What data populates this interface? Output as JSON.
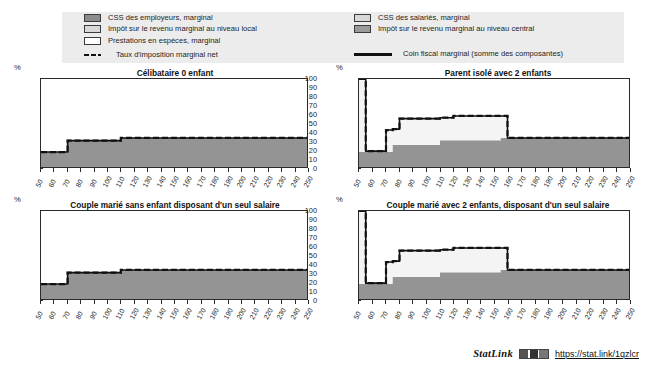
{
  "legend": {
    "left_items": [
      {
        "label": "CSS des employeurs, marginal",
        "swatch": "dark-gray-swatch"
      },
      {
        "label": "Impôt sur le revenu marginal au niveau local",
        "swatch": "light-gray-swatch"
      },
      {
        "label": "Prestations en espèces, marginal",
        "swatch": "white-swatch"
      }
    ],
    "left_line": {
      "label": "Taux d'imposition marginal net",
      "style": "dashed"
    },
    "right_items": [
      {
        "label": "CSS des salariés, marginal",
        "swatch": "light-gray-swatch"
      },
      {
        "label": "Impôt sur le revenu marginal au niveau central",
        "swatch": "mid-gray-swatch"
      }
    ],
    "right_line": {
      "label": "Coin fiscal marginal (somme des composantes)",
      "style": "solid"
    }
  },
  "axis": {
    "y_unit": "%",
    "y_ticks": [
      100,
      90,
      80,
      70,
      60,
      50,
      40,
      30,
      20,
      10,
      0
    ],
    "x_ticks": [
      50,
      60,
      70,
      80,
      90,
      100,
      110,
      120,
      130,
      140,
      150,
      160,
      170,
      180,
      190,
      200,
      210,
      220,
      230,
      240,
      250
    ]
  },
  "statlink": {
    "word": "StatLink",
    "glyph": "statlink-barcode-icon",
    "url": "https://stat.link/1qzlcr"
  },
  "chart_data": [
    {
      "type": "area",
      "panel": "top-left",
      "title": "Célibataire 0 enfant",
      "xlabel": "",
      "ylabel": "%",
      "xlim": [
        50,
        250
      ],
      "ylim": [
        0,
        100
      ],
      "grid": false,
      "x": [
        50,
        60,
        70,
        80,
        90,
        100,
        110,
        120,
        130,
        140,
        150,
        160,
        170,
        180,
        190,
        200,
        210,
        220,
        230,
        240,
        250
      ],
      "series": [
        {
          "name": "CSS des employeurs, marginal",
          "values": [
            17,
            17,
            30,
            30,
            30,
            30,
            33,
            33,
            33,
            33,
            33,
            33,
            33,
            33,
            33,
            33,
            33,
            33,
            33,
            33,
            33
          ]
        },
        {
          "name": "Coin fiscal marginal (somme des composantes)",
          "values": [
            17,
            17,
            30,
            30,
            30,
            30,
            33,
            33,
            33,
            33,
            33,
            33,
            33,
            33,
            33,
            33,
            33,
            33,
            33,
            33,
            33
          ]
        },
        {
          "name": "Taux d'imposition marginal net",
          "values": [
            17,
            17,
            30,
            30,
            30,
            30,
            33,
            33,
            33,
            33,
            33,
            33,
            33,
            33,
            33,
            33,
            33,
            33,
            33,
            33,
            33
          ]
        }
      ]
    },
    {
      "type": "area",
      "panel": "top-right",
      "title": "Parent isolé avec 2 enfants",
      "xlabel": "",
      "ylabel": "%",
      "xlim": [
        50,
        250
      ],
      "ylim": [
        0,
        100
      ],
      "grid": false,
      "x": [
        50,
        52,
        55,
        60,
        65,
        70,
        75,
        80,
        90,
        100,
        110,
        120,
        130,
        140,
        150,
        155,
        160,
        170,
        180,
        190,
        200,
        210,
        220,
        230,
        240,
        250
      ],
      "series": [
        {
          "name": "CSS des employeurs, marginal",
          "values": [
            17,
            17,
            17,
            17,
            17,
            17,
            25,
            25,
            25,
            25,
            30,
            30,
            30,
            30,
            30,
            33,
            33,
            33,
            33,
            33,
            33,
            33,
            33,
            33,
            33,
            33
          ]
        },
        {
          "name": "Coin fiscal marginal (somme des composantes)",
          "values": [
            100,
            100,
            18,
            18,
            18,
            42,
            43,
            55,
            55,
            55,
            56,
            58,
            58,
            58,
            58,
            58,
            33,
            33,
            33,
            33,
            33,
            33,
            33,
            33,
            33,
            33
          ]
        },
        {
          "name": "Taux d'imposition marginal net",
          "values": [
            100,
            100,
            18,
            18,
            18,
            42,
            43,
            55,
            55,
            55,
            56,
            58,
            58,
            58,
            58,
            58,
            33,
            33,
            33,
            33,
            33,
            33,
            33,
            33,
            33,
            33
          ]
        }
      ]
    },
    {
      "type": "area",
      "panel": "bottom-left",
      "title": "Couple marié sans enfant disposant d'un seul salaire",
      "xlabel": "",
      "ylabel": "%",
      "xlim": [
        50,
        250
      ],
      "ylim": [
        0,
        100
      ],
      "grid": false,
      "x": [
        50,
        60,
        70,
        80,
        90,
        100,
        110,
        120,
        130,
        140,
        150,
        160,
        170,
        180,
        190,
        200,
        210,
        220,
        230,
        240,
        250
      ],
      "series": [
        {
          "name": "CSS des employeurs, marginal",
          "values": [
            17,
            17,
            30,
            30,
            30,
            30,
            33,
            33,
            33,
            33,
            33,
            33,
            33,
            33,
            33,
            33,
            33,
            33,
            33,
            33,
            33
          ]
        },
        {
          "name": "Coin fiscal marginal (somme des composantes)",
          "values": [
            17,
            17,
            30,
            30,
            30,
            30,
            33,
            33,
            33,
            33,
            33,
            33,
            33,
            33,
            33,
            33,
            33,
            33,
            33,
            33,
            33
          ]
        },
        {
          "name": "Taux d'imposition marginal net",
          "values": [
            17,
            17,
            30,
            30,
            30,
            30,
            33,
            33,
            33,
            33,
            33,
            33,
            33,
            33,
            33,
            33,
            33,
            33,
            33,
            33,
            33
          ]
        }
      ]
    },
    {
      "type": "area",
      "panel": "bottom-right",
      "title": "Couple marié avec 2 enfants, disposant d'un seul salaire",
      "xlabel": "",
      "ylabel": "%",
      "xlim": [
        50,
        250
      ],
      "ylim": [
        0,
        100
      ],
      "grid": false,
      "x": [
        50,
        52,
        55,
        60,
        65,
        70,
        75,
        80,
        90,
        100,
        110,
        120,
        130,
        140,
        150,
        155,
        160,
        170,
        180,
        190,
        200,
        210,
        220,
        230,
        240,
        250
      ],
      "series": [
        {
          "name": "CSS des employeurs, marginal",
          "values": [
            17,
            17,
            17,
            17,
            17,
            17,
            25,
            25,
            25,
            25,
            30,
            30,
            30,
            30,
            30,
            33,
            33,
            33,
            33,
            33,
            33,
            33,
            33,
            33,
            33,
            33
          ]
        },
        {
          "name": "Coin fiscal marginal (somme des composantes)",
          "values": [
            100,
            100,
            18,
            18,
            18,
            42,
            43,
            55,
            55,
            55,
            56,
            58,
            58,
            58,
            58,
            58,
            33,
            33,
            33,
            33,
            33,
            33,
            33,
            33,
            33,
            33
          ]
        },
        {
          "name": "Taux d'imposition marginal net",
          "values": [
            100,
            100,
            18,
            18,
            18,
            42,
            43,
            55,
            55,
            55,
            56,
            58,
            58,
            58,
            58,
            58,
            33,
            33,
            33,
            33,
            33,
            33,
            33,
            33,
            33,
            33
          ]
        }
      ]
    }
  ]
}
